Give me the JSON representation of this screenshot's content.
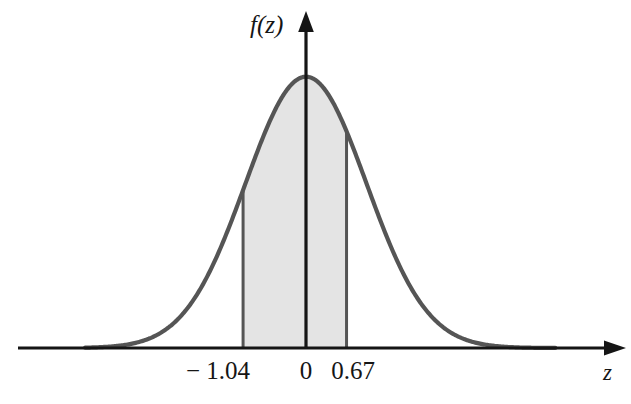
{
  "figure": {
    "title": "",
    "background_color": "#ffffff",
    "width": 631,
    "height": 404
  },
  "axes": {
    "y_axis_label": "f(z)",
    "x_axis_label": "z",
    "x_axis_color": "#151515",
    "y_axis_color": "#151515"
  },
  "ticks": {
    "left": "− 1.04",
    "center": "0",
    "right": "0.67"
  },
  "colors": {
    "curve": "#555555",
    "shading": "#e4e4e4",
    "shading_border": "#555555",
    "axis": "#151515",
    "text": "#151515"
  },
  "chart_data": {
    "type": "area",
    "title": "",
    "xlabel": "z",
    "ylabel": "f(z)",
    "distribution": "standard normal",
    "mean": 0,
    "std_dev": 1,
    "xlim": [
      -4.0,
      4.15
    ],
    "ylim": [
      0,
      0.44
    ],
    "grid": false,
    "legend": null,
    "tick_values": [
      -1.04,
      0,
      0.67
    ],
    "tick_labels": [
      "− 1.04",
      "0",
      "0.67"
    ],
    "shaded_region": {
      "from": -1.04,
      "to": 0.67,
      "label": "",
      "fill": "#e4e4e4"
    },
    "boundary_lines": [
      {
        "x": -1.04,
        "from_y": 0,
        "to_y": 0.2323
      },
      {
        "x": 0.67,
        "from_y": 0,
        "to_y": 0.3187
      }
    ],
    "curve_x": [
      -4.0,
      -3.8,
      -3.6,
      -3.4,
      -3.2,
      -3.0,
      -2.8,
      -2.6,
      -2.4,
      -2.2,
      -2.0,
      -1.8,
      -1.6,
      -1.4,
      -1.2,
      -1.0,
      -0.8,
      -0.6,
      -0.4,
      -0.2,
      0.0,
      0.2,
      0.4,
      0.6,
      0.8,
      1.0,
      1.2,
      1.4,
      1.6,
      1.8,
      2.0,
      2.2,
      2.4,
      2.6,
      2.8,
      3.0,
      3.2,
      3.4,
      3.6,
      3.8,
      4.0
    ],
    "curve_y": [
      0.0001,
      0.0003,
      0.0006,
      0.0012,
      0.0024,
      0.0044,
      0.0079,
      0.0136,
      0.0224,
      0.0355,
      0.054,
      0.079,
      0.1109,
      0.1497,
      0.1942,
      0.242,
      0.2897,
      0.3332,
      0.3683,
      0.391,
      0.3989,
      0.391,
      0.3683,
      0.3332,
      0.2897,
      0.242,
      0.1942,
      0.1497,
      0.1109,
      0.079,
      0.054,
      0.0355,
      0.0224,
      0.0136,
      0.0079,
      0.0044,
      0.0024,
      0.0012,
      0.0006,
      0.0003,
      0.0001
    ]
  }
}
